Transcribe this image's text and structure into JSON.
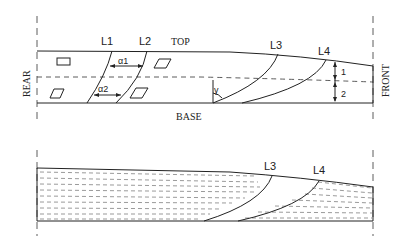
{
  "top_diagram": {
    "labels": {
      "top": "TOP",
      "base": "BASE",
      "rear": "REAR",
      "front": "FRONT",
      "l1": "L1",
      "l2": "L2",
      "l3": "L3",
      "l4": "L4",
      "alpha1": "α1",
      "alpha2": "α2",
      "gamma": "γ",
      "layer1": "1",
      "layer2": "2"
    }
  },
  "bottom_diagram": {
    "labels": {
      "l3": "L3",
      "l4": "L4"
    }
  }
}
